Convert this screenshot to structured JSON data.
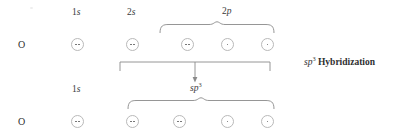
{
  "figure": {
    "type": "orbital-hybridization-diagram",
    "element": "O",
    "caption_right": {
      "hybrid": "sp",
      "superscript": "3",
      "word": "Hybridization"
    },
    "colors": {
      "orbital_stroke": "#b9b9b9",
      "electron_dot": "#666666",
      "text": "#2f2f2f",
      "bracket_stroke": "#8a8a8a",
      "background": "#ffffff"
    },
    "rows": [
      {
        "id": "ground-state",
        "atom_label": "O",
        "groups": [
          {
            "id": "1s",
            "label_base": "1",
            "label_italic": "s",
            "label_sup": "",
            "orbitals": [
              {
                "electrons": 2
              }
            ]
          },
          {
            "id": "2s",
            "label_base": "2",
            "label_italic": "s",
            "label_sup": "",
            "orbitals": [
              {
                "electrons": 2
              }
            ]
          },
          {
            "id": "2p",
            "label_base": "2",
            "label_italic": "p",
            "label_sup": "",
            "brace": true,
            "orbitals": [
              {
                "electrons": 2
              },
              {
                "electrons": 1
              },
              {
                "electrons": 1
              }
            ]
          }
        ]
      },
      {
        "id": "hybridized-state",
        "atom_label": "O",
        "groups": [
          {
            "id": "1s",
            "label_base": "1",
            "label_italic": "s",
            "label_sup": "",
            "orbitals": [
              {
                "electrons": 2
              }
            ]
          },
          {
            "id": "sp3",
            "label_base": "",
            "label_italic": "sp",
            "label_sup": "3",
            "brace": true,
            "orbitals": [
              {
                "electrons": 2
              },
              {
                "electrons": 2
              },
              {
                "electrons": 1
              },
              {
                "electrons": 1
              }
            ]
          }
        ]
      }
    ],
    "transition": {
      "bracket_spans": "2s through 2p",
      "arrow_direction": "down",
      "target_label_italic": "sp",
      "target_label_sup": "3"
    }
  }
}
